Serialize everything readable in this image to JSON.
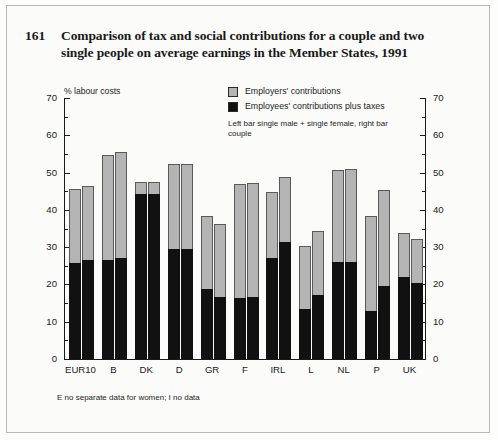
{
  "figure": {
    "number": "161",
    "title": "Comparison of tax and social contributions for a couple and two single people on average earnings in the Member States, 1991",
    "unit_label": "% labour costs",
    "footnote": "E no separate data for women; I no data"
  },
  "legend": {
    "employers": "Employers' contributions",
    "employees": "Employees' contributions plus taxes",
    "note": "Left bar single male + single female, right bar couple",
    "employers_color": "#b4b4b4",
    "employees_color": "#111111"
  },
  "chart_data": {
    "type": "bar",
    "title": "Comparison of tax and social contributions for a couple and two single people on average earnings in the Member States, 1991",
    "xlabel": "",
    "ylabel": "% labour costs",
    "ylim": [
      0,
      70
    ],
    "yticks": [
      0,
      10,
      20,
      30,
      40,
      50,
      60,
      70
    ],
    "yticks_minor_step": 5,
    "grid": false,
    "legend_position": "top-right",
    "stacked": true,
    "categories": [
      "EUR10",
      "B",
      "DK",
      "D",
      "GR",
      "F",
      "IRL",
      "L",
      "NL",
      "P",
      "UK"
    ],
    "bar_groups": [
      {
        "name": "single male + single female",
        "series": [
          {
            "name": "Employees' contributions plus taxes",
            "color": "#111111",
            "values": [
              25.5,
              26.2,
              44.0,
              29.3,
              18.4,
              16.2,
              26.7,
              13.2,
              25.8,
              12.5,
              21.7
            ]
          },
          {
            "name": "Employers' contributions",
            "color": "#b4b4b4",
            "values": [
              20.2,
              28.5,
              3.4,
              23.1,
              20.0,
              30.7,
              18.1,
              17.1,
              25.0,
              25.8,
              12.1
            ]
          }
        ],
        "totals": [
          45.7,
          54.7,
          47.4,
          52.4,
          38.4,
          46.9,
          44.8,
          30.3,
          50.8,
          38.3,
          33.8
        ]
      },
      {
        "name": "couple",
        "series": [
          {
            "name": "Employees' contributions plus taxes",
            "color": "#111111",
            "values": [
              26.3,
              26.9,
              44.0,
              29.3,
              16.3,
              16.4,
              31.0,
              17.0,
              25.8,
              19.2,
              20.0
            ]
          },
          {
            "name": "Employers' contributions",
            "color": "#b4b4b4",
            "values": [
              20.2,
              28.6,
              3.4,
              23.1,
              19.9,
              30.9,
              17.9,
              17.2,
              25.2,
              26.0,
              12.3
            ]
          }
        ],
        "totals": [
          46.5,
          55.5,
          47.4,
          52.4,
          36.2,
          47.3,
          48.9,
          34.2,
          51.0,
          45.2,
          32.3
        ]
      }
    ]
  }
}
